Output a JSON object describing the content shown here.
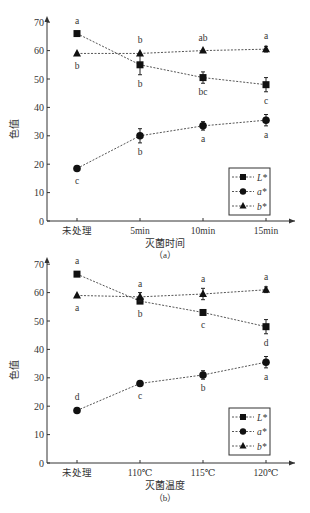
{
  "chart_data": [
    {
      "type": "line",
      "panel_label": "（a）",
      "xlabel": "灭菌时间",
      "ylabel": "色值",
      "categories": [
        "未处理",
        "5min",
        "10min",
        "15min"
      ],
      "ylim": [
        0,
        70
      ],
      "yticks": [
        0,
        10,
        20,
        30,
        40,
        50,
        60,
        70
      ],
      "grid": false,
      "legend_position": "lower right",
      "series": [
        {
          "name": "L*",
          "marker": "square",
          "values": [
            66,
            55,
            50.5,
            48
          ],
          "errors": [
            0.5,
            3.5,
            2,
            2.5
          ],
          "letters": [
            "a",
            "b",
            "bc",
            "c"
          ],
          "letter_pos": [
            "above",
            "below",
            "below",
            "below"
          ]
        },
        {
          "name": "a*",
          "marker": "circle",
          "values": [
            18.5,
            30,
            33.5,
            35.5
          ],
          "errors": [
            0.5,
            2.5,
            1.5,
            2
          ],
          "letters": [
            "c",
            "b",
            "a",
            "a"
          ],
          "letter_pos": [
            "below",
            "below",
            "below",
            "below"
          ]
        },
        {
          "name": "b*",
          "marker": "triangle",
          "values": [
            59,
            59,
            60,
            60.5
          ],
          "errors": [
            0.5,
            0.5,
            0.5,
            1
          ],
          "letters": [
            "b",
            "b",
            "ab",
            "a"
          ],
          "letter_pos": [
            "below",
            "above",
            "above",
            "above"
          ]
        }
      ]
    },
    {
      "type": "line",
      "panel_label": "（b）",
      "xlabel": "灭菌温度",
      "ylabel": "色值",
      "categories": [
        "未处理",
        "110℃",
        "115℃",
        "120℃"
      ],
      "ylim": [
        0,
        70
      ],
      "yticks": [
        0,
        10,
        20,
        30,
        40,
        50,
        60,
        70
      ],
      "grid": false,
      "legend_position": "lower right",
      "series": [
        {
          "name": "L*",
          "marker": "square",
          "values": [
            66.5,
            57,
            53,
            48
          ],
          "errors": [
            0.5,
            0.5,
            0.5,
            2.5
          ],
          "letters": [
            "a",
            "b",
            "c",
            "d"
          ],
          "letter_pos": [
            "above",
            "below",
            "below",
            "below"
          ]
        },
        {
          "name": "a*",
          "marker": "circle",
          "values": [
            18.5,
            28,
            31,
            35.5
          ],
          "errors": [
            0.5,
            0.5,
            1.5,
            2
          ],
          "letters": [
            "d",
            "c",
            "b",
            "a"
          ],
          "letter_pos": [
            "above",
            "below",
            "below",
            "below"
          ]
        },
        {
          "name": "b*",
          "marker": "triangle",
          "values": [
            59,
            58.5,
            59.5,
            61
          ],
          "errors": [
            0.5,
            1.5,
            2,
            1
          ],
          "letters": [
            "a",
            "a",
            "a",
            "a"
          ],
          "letter_pos": [
            "below",
            "above",
            "above",
            "above"
          ]
        }
      ]
    }
  ]
}
